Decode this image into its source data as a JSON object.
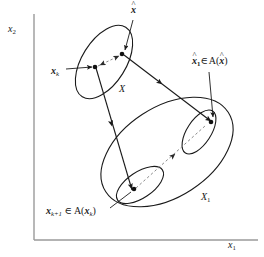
{
  "figure": {
    "kind": "mathematical-diagram",
    "background_color": "#ffffff",
    "stroke_color": "#1a1a1a",
    "dashed_color": "#8a8a8a"
  },
  "axes": {
    "y_label": "x",
    "y_label_sub": "2",
    "x_label": "x",
    "x_label_sub": "1",
    "origin": {
      "x": 34,
      "y": 240
    },
    "y_top": 14,
    "x_right": 258,
    "color": "#9a9a9a"
  },
  "labels": {
    "x_hat": {
      "base": "x",
      "hat": "^",
      "bold": true
    },
    "x_k": {
      "base": "x",
      "sub": "k",
      "bold": true
    },
    "set_X": {
      "text": "X"
    },
    "x_hat_1_in_A_x_hat": {
      "lead_base": "x",
      "lead_hat": "^",
      "lead_sub": "1",
      "relation": "∈",
      "map": "A",
      "arg_base": "x",
      "arg_hat": "^"
    },
    "set_X_1": {
      "text": "X",
      "sub": "1"
    },
    "x_k_plus_1_in_A_x_k": {
      "lead_base": "x",
      "lead_sub": "k+1",
      "relation": "∈",
      "map": "A",
      "arg_base": "x",
      "arg_sub": "k"
    }
  },
  "shapes": {
    "ellipse_X": {
      "cx": 104,
      "cy": 62,
      "rx": 41,
      "ry": 22,
      "rotate": -58
    },
    "ellipse_X1": {
      "cx": 167,
      "cy": 152,
      "rx": 73,
      "ry": 45,
      "rotate": -33
    },
    "ellipse_inner_right": {
      "cx": 199,
      "cy": 132,
      "rx": 24,
      "ry": 12,
      "rotate": -58
    },
    "ellipse_inner_left": {
      "cx": 140,
      "cy": 185,
      "rx": 26,
      "ry": 13,
      "rotate": -33
    }
  },
  "points": [
    {
      "name": "x-hat-point",
      "x": 122,
      "y": 54
    },
    {
      "name": "x-k-point",
      "x": 96,
      "y": 66
    },
    {
      "name": "x-hat-1-point",
      "x": 211,
      "y": 121
    },
    {
      "name": "x-k-plus-1-point",
      "x": 134,
      "y": 189
    }
  ],
  "connections": [
    {
      "name": "xk-to-xhat-dashed",
      "style": "dashed",
      "from": "x-k-point",
      "to": "x-hat-point"
    },
    {
      "name": "xk-to-xk1-solid",
      "style": "solid",
      "from": "x-k-point",
      "to": "x-k-plus-1-point"
    },
    {
      "name": "xhat-to-xhat1-solid",
      "style": "solid",
      "from": "x-hat-point",
      "to": "x-hat-1-point"
    },
    {
      "name": "xk1-to-xhat1-dashed",
      "style": "dashed",
      "from": "x-k-plus-1-point",
      "to": "x-hat-1-point"
    }
  ]
}
